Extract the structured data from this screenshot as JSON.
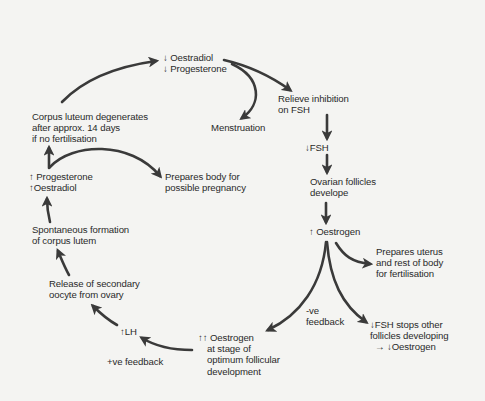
{
  "diagram": {
    "title": "",
    "type": "cycle",
    "colors": {
      "background": "#f4f4f2",
      "arrow": "#3a3a3a",
      "text": "#2a2a2a"
    },
    "nodes": {
      "decrease_oestradiol_progesterone": {
        "line1": "↓ Oestradiol",
        "line2": "↓ Progesterone"
      },
      "relieve_inhibition": {
        "line1": "Relieve inhibition",
        "line2": "on FSH"
      },
      "menstruation": {
        "line1": "Menstruation"
      },
      "corpus_luteum_degenerates": {
        "line1": "Corpus luteum degenerates",
        "line2": "after approx. 14 days",
        "line3": "if no fertilisation"
      },
      "fsh_increase": {
        "line1": "↓FSH"
      },
      "increase_progesterone_oestradiol": {
        "line1": "↑ Progesterone",
        "line2": "↑Oestradiol"
      },
      "prepares_body_pregnancy": {
        "line1": "Prepares body for",
        "line2": "possible pregnancy"
      },
      "ovarian_follicles": {
        "line1": "Ovarian follicles",
        "line2": "develope"
      },
      "spontaneous_formation": {
        "line1": "Spontaneous formation",
        "line2": "of corpus lutem"
      },
      "increase_oestrogen": {
        "line1": "↑ Oestrogen"
      },
      "prepares_uterus": {
        "line1": "Prepares uterus",
        "line2": "and rest of body",
        "line3": "for fertilisation"
      },
      "release_oocyte": {
        "line1": "Release of secondary",
        "line2": "oocyte from ovary"
      },
      "neg_feedback": {
        "line1": "-ve",
        "line2": "feedback"
      },
      "fsh_stops_follicles": {
        "line1": "↓FSH stops other",
        "line2": "follicles developing",
        "line3": "→ ↓Oestrogen"
      },
      "increase_lh": {
        "line1": "↑LH"
      },
      "peak_oestrogen": {
        "line1": "↑↑ Oestrogen",
        "line2": "at stage of",
        "line3": "optimum follicular",
        "line4": "development"
      },
      "pos_feedback": {
        "line1": "+ve feedback"
      }
    },
    "edges": [
      {
        "from": "decrease_oestradiol_progesterone",
        "to": "relieve_inhibition"
      },
      {
        "from": "decrease_oestradiol_progesterone",
        "to": "menstruation"
      },
      {
        "from": "relieve_inhibition",
        "to": "fsh_increase"
      },
      {
        "from": "fsh_increase",
        "to": "ovarian_follicles"
      },
      {
        "from": "ovarian_follicles",
        "to": "increase_oestrogen"
      },
      {
        "from": "increase_oestrogen",
        "to": "prepares_uterus"
      },
      {
        "from": "increase_oestrogen",
        "to": "fsh_stops_follicles",
        "label": "-ve feedback"
      },
      {
        "from": "increase_oestrogen",
        "to": "peak_oestrogen"
      },
      {
        "from": "peak_oestrogen",
        "to": "increase_lh",
        "label": "+ve feedback"
      },
      {
        "from": "increase_lh",
        "to": "release_oocyte"
      },
      {
        "from": "release_oocyte",
        "to": "spontaneous_formation"
      },
      {
        "from": "spontaneous_formation",
        "to": "increase_progesterone_oestradiol"
      },
      {
        "from": "increase_progesterone_oestradiol",
        "to": "corpus_luteum_degenerates"
      },
      {
        "from": "increase_progesterone_oestradiol",
        "to": "prepares_body_pregnancy"
      },
      {
        "from": "corpus_luteum_degenerates",
        "to": "decrease_oestradiol_progesterone"
      }
    ]
  }
}
